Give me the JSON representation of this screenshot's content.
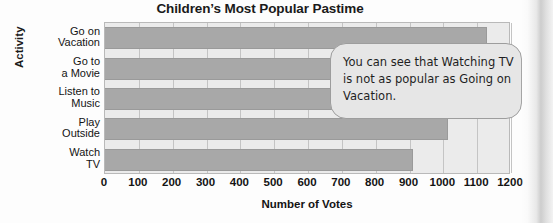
{
  "chart_data": {
    "type": "bar",
    "orientation": "horizontal",
    "title": "Children’s Most Popular Pastime",
    "xlabel": "Number of Votes",
    "ylabel": "Activity",
    "categories": [
      "Go on Vacation",
      "Go to a Movie",
      "Listen to Music",
      "Play Outside",
      "Watch TV"
    ],
    "category_lines": [
      [
        "Go on",
        "Vacation"
      ],
      [
        "Go to",
        "a Movie"
      ],
      [
        "Listen to",
        "Music"
      ],
      [
        "Play",
        "Outside"
      ],
      [
        "Watch",
        "TV"
      ]
    ],
    "values": [
      1130,
      700,
      670,
      1015,
      910
    ],
    "xlim": [
      0,
      1200
    ],
    "xticks": [
      0,
      100,
      200,
      300,
      400,
      500,
      600,
      700,
      800,
      900,
      1000,
      1100,
      1200
    ],
    "xtick_labels": [
      "0",
      "100",
      "200",
      "300",
      "400",
      "500",
      "600",
      "700",
      "800",
      "900",
      "1000",
      "1100",
      "1200"
    ],
    "grid": true,
    "legend": null,
    "bar_color": "#a8a8a8",
    "plot_background": "#ebebeb"
  },
  "annotation": {
    "callout_text": "You can see that Watching TV is not as popular as Going on Vacation."
  }
}
